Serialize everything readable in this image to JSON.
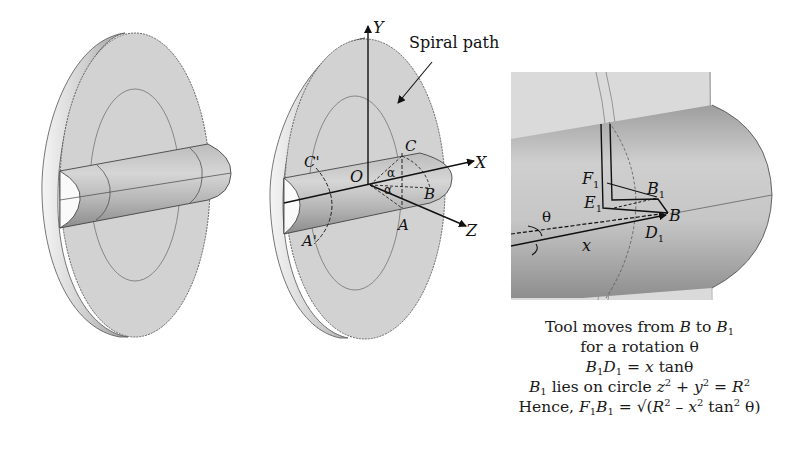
{
  "figure": {
    "type": "engineering-diagram",
    "panels": [
      {
        "id": "left",
        "description": "Disc with cylindrical shaft, plain view"
      },
      {
        "id": "middle",
        "description": "Disc with shaft and coordinate axes"
      },
      {
        "id": "right",
        "description": "Enlarged view of tool path on shaft"
      }
    ]
  },
  "middle": {
    "axis_y": "Y",
    "axis_x": "X",
    "axis_z": "Z",
    "origin": "O",
    "point_c_right": "C",
    "point_c_left": "C'",
    "point_a_right": "A",
    "point_a_left": "A'",
    "point_b": "B",
    "angle_alpha_upper": "α",
    "angle_alpha_lower": "α",
    "spiral_label": "Spiral path"
  },
  "inset": {
    "f1": "F",
    "f1_sub": "1",
    "b1": "B",
    "b1_sub": "1",
    "e1": "E",
    "e1_sub": "1",
    "b": "B",
    "d1": "D",
    "d1_sub": "1",
    "theta": "θ",
    "x": "x"
  },
  "caption": {
    "line1": {
      "pre": "Tool moves from ",
      "b": "B",
      "mid": " to ",
      "b1": "B",
      "b1_sub": "1"
    },
    "line2": {
      "text": "for a rotation θ"
    },
    "line3": {
      "b": "B",
      "b_sub": "1",
      "d": "D",
      "d_sub": "1",
      "eq": " = ",
      "x": "x",
      "post": " tanθ"
    },
    "line4": {
      "b": "B",
      "b_sub": "1",
      "mid": " lies on circle ",
      "z": "z",
      "z_sup": "2",
      "plus": " + ",
      "y": "y",
      "y_sup": "2",
      "eq": " = ",
      "r": "R",
      "r_sup": "2"
    },
    "line5": {
      "pre": "Hence, ",
      "f": "F",
      "f_sub": "1",
      "b": "B",
      "b_sub": "1",
      "eq": " = √(",
      "r": "R",
      "r_sup": "2",
      "minus": " – ",
      "x": "x",
      "x_sup": "2",
      "tan": " tan",
      "tan_sup": "2",
      "post": " θ)"
    }
  }
}
